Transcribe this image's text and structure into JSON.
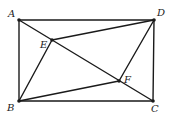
{
  "figure": {
    "type": "geometry",
    "points": [
      {
        "id": "A",
        "label": "A"
      },
      {
        "id": "B",
        "label": "B"
      },
      {
        "id": "C",
        "label": "C"
      },
      {
        "id": "D",
        "label": "D"
      },
      {
        "id": "E",
        "label": "E"
      },
      {
        "id": "F",
        "label": "F"
      }
    ],
    "segments": [
      [
        "A",
        "D"
      ],
      [
        "D",
        "C"
      ],
      [
        "C",
        "B"
      ],
      [
        "B",
        "A"
      ],
      [
        "A",
        "C"
      ],
      [
        "B",
        "E"
      ],
      [
        "E",
        "D"
      ],
      [
        "B",
        "F"
      ],
      [
        "F",
        "D"
      ]
    ],
    "line_color": "#1a1a1a"
  }
}
